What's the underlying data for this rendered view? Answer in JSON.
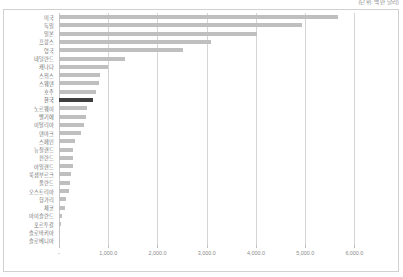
{
  "annotation": {
    "unit_note": "(단위: 백만 달러)"
  },
  "chart_data": {
    "type": "bar",
    "orientation": "horizontal",
    "title": "",
    "subtitle": "",
    "xlabel": "",
    "ylabel": "",
    "xlim": [
      0,
      6500
    ],
    "grid": true,
    "legend": false,
    "highlight_category": "한국",
    "highlight_color": "#3f3f3f",
    "bar_color": "#bfbfbf",
    "xticks": [
      0,
      1000,
      2000,
      3000,
      4000,
      5000,
      6000
    ],
    "xtick_labels": [
      "-",
      "1,000.0",
      "2,000.0",
      "3,000.0",
      "4,000.0",
      "5,000.0",
      "6,000.0"
    ],
    "categories": [
      "미국",
      "독일",
      "일본",
      "프랑스",
      "영국",
      "네덜란드",
      "캐나다",
      "스위스",
      "스웨덴",
      "호주",
      "한국",
      "노르웨이",
      "벨기에",
      "이탈리아",
      "덴마크",
      "스페인",
      "뉴질랜드",
      "핀란드",
      "아일랜드",
      "룩셈부르크",
      "폴란드",
      "오스트리아",
      "헝가리",
      "체코",
      "아이슬란드",
      "포르투갈",
      "슬로바키아",
      "슬로베니아"
    ],
    "values": [
      5670,
      4940,
      4020,
      3080,
      2520,
      1350,
      1000,
      830,
      810,
      760,
      690,
      570,
      545,
      500,
      450,
      330,
      290,
      280,
      275,
      250,
      230,
      200,
      140,
      120,
      60,
      45,
      30,
      20
    ]
  }
}
